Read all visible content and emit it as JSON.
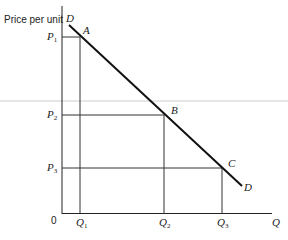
{
  "diagram": {
    "y_axis_label": "Price per unit",
    "x_axis_label": "Q",
    "origin_label": "0",
    "curve_label_start": "D",
    "curve_label_end": "D",
    "points": [
      {
        "label": "A",
        "price": "P",
        "price_sub": "1",
        "quantity": "Q",
        "quantity_sub": "1"
      },
      {
        "label": "B",
        "price": "P",
        "price_sub": "2",
        "quantity": "Q",
        "quantity_sub": "2"
      },
      {
        "label": "C",
        "price": "P",
        "price_sub": "3",
        "quantity": "Q",
        "quantity_sub": "3"
      }
    ],
    "colors": {
      "line": "#111111",
      "guide": "#333333",
      "artifact": "#e6e6e6"
    }
  }
}
